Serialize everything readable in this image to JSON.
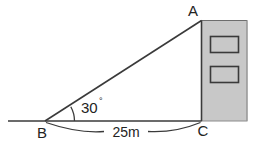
{
  "figure": {
    "vertices": {
      "apex_label": "A",
      "observer_label": "B",
      "base_label": "C"
    },
    "angle": {
      "value": "30",
      "degree_symbol": "°",
      "full": "30°"
    },
    "dimension": {
      "base_length": "25m"
    },
    "building": {
      "fill_color": "#c8c8c8",
      "stroke_color": "#6e6e6e",
      "window_count": 2,
      "window_fill": "#c8c8c8",
      "window_stroke": "#3a3a3a"
    },
    "line_color": "#3a3a3a",
    "background_color": "#ffffff"
  }
}
